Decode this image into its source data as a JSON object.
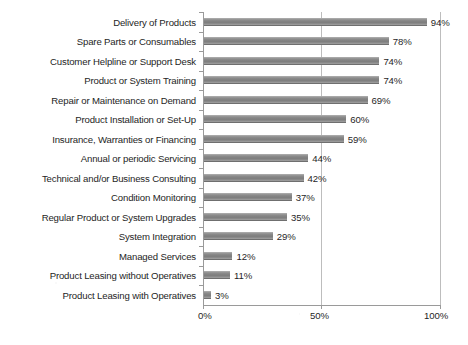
{
  "chart_data": {
    "type": "bar",
    "orientation": "horizontal",
    "title": "",
    "xlabel": "",
    "ylabel": "",
    "xlim": [
      0,
      100
    ],
    "xticks": [
      "0%",
      "50%",
      "100%"
    ],
    "xtick_values": [
      0,
      50,
      100
    ],
    "grid": true,
    "legend": false,
    "value_label_suffix": "%",
    "categories": [
      "Delivery of Products",
      "Spare Parts or Consumables",
      "Customer Helpline or Support Desk",
      "Product or System Training",
      "Repair or Maintenance on Demand",
      "Product Installation or Set-Up",
      "Insurance, Warranties or Financing",
      "Annual or periodic Servicing",
      "Technical and/or Business Consulting",
      "Condition Monitoring",
      "Regular Product or System Upgrades",
      "System Integration",
      "Managed Services",
      "Product Leasing without Operatives",
      "Product Leasing with Operatives"
    ],
    "values": [
      94,
      78,
      74,
      74,
      69,
      60,
      59,
      44,
      42,
      37,
      35,
      29,
      12,
      11,
      3
    ],
    "value_labels": [
      "94%",
      "78%",
      "74%",
      "74%",
      "69%",
      "60%",
      "59%",
      "44%",
      "42%",
      "37%",
      "35%",
      "29%",
      "12%",
      "11%",
      "3%"
    ],
    "colors": {
      "bar": "#8a8a8a",
      "bar_edge_light": "#a8a8a8",
      "bar_edge_dark": "#6f6f6f",
      "axis": "#9a9a9a",
      "gridline": "#bdbdbd",
      "text": "#252525",
      "background": "#ffffff"
    }
  }
}
